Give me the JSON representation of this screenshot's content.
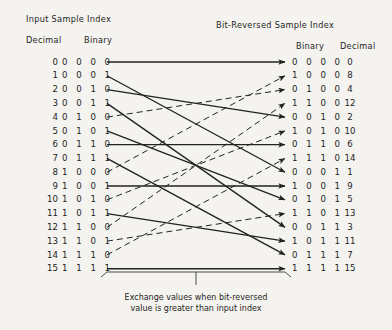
{
  "headers": {
    "left_title": "Input Sample Index",
    "left_decimal": "Decimal",
    "left_binary": "Binary",
    "right_title": "Bit-Reversed Sample Index",
    "right_binary": "Binary",
    "right_decimal": "Decimal"
  },
  "caption_line1": "Exchange values when bit-reversed",
  "caption_line2": "value is greater than input index",
  "colors": {
    "background": "#f5f3ef",
    "ink": "#1a1a1a",
    "line": "#222222"
  },
  "chart_data": {
    "type": "diagram",
    "bits": 4,
    "left_column_header": "Input Sample Index",
    "right_column_header": "Bit-Reversed Sample Index",
    "rows": [
      {
        "index": 0,
        "decimal": "0",
        "binary": "0 0 0 0",
        "rev_binary": "0 0 0 0",
        "rev_decimal": "0",
        "rev_index": 0,
        "style": "solid"
      },
      {
        "index": 1,
        "decimal": "1",
        "binary": "0 0 0 1",
        "rev_binary": "1 0 0 0",
        "rev_decimal": "8",
        "rev_index": 8,
        "style": "solid"
      },
      {
        "index": 2,
        "decimal": "2",
        "binary": "0 0 1 0",
        "rev_binary": "0 1 0 0",
        "rev_decimal": "4",
        "rev_index": 4,
        "style": "solid"
      },
      {
        "index": 3,
        "decimal": "3",
        "binary": "0 0 1 1",
        "rev_binary": "1 1 0 0",
        "rev_decimal": "12",
        "rev_index": 12,
        "style": "solid"
      },
      {
        "index": 4,
        "decimal": "4",
        "binary": "0 1 0 0",
        "rev_binary": "0 0 1 0",
        "rev_decimal": "2",
        "rev_index": 2,
        "style": "dashed"
      },
      {
        "index": 5,
        "decimal": "5",
        "binary": "0 1 0 1",
        "rev_binary": "1 0 1 0",
        "rev_decimal": "10",
        "rev_index": 10,
        "style": "solid"
      },
      {
        "index": 6,
        "decimal": "6",
        "binary": "0 1 1 0",
        "rev_binary": "0 1 1 0",
        "rev_decimal": "6",
        "rev_index": 6,
        "style": "solid"
      },
      {
        "index": 7,
        "decimal": "7",
        "binary": "0 1 1 1",
        "rev_binary": "1 1 1 0",
        "rev_decimal": "14",
        "rev_index": 14,
        "style": "solid"
      },
      {
        "index": 8,
        "decimal": "8",
        "binary": "1 0 0 0",
        "rev_binary": "0 0 0 1",
        "rev_decimal": "1",
        "rev_index": 1,
        "style": "dashed"
      },
      {
        "index": 9,
        "decimal": "9",
        "binary": "1 0 0 1",
        "rev_binary": "1 0 0 1",
        "rev_decimal": "9",
        "rev_index": 9,
        "style": "solid"
      },
      {
        "index": 10,
        "decimal": "10",
        "binary": "1 0 1 0",
        "rev_binary": "0 1 0 1",
        "rev_decimal": "5",
        "rev_index": 5,
        "style": "dashed"
      },
      {
        "index": 11,
        "decimal": "11",
        "binary": "1 0 1 1",
        "rev_binary": "1 1 0 1",
        "rev_decimal": "13",
        "rev_index": 13,
        "style": "solid"
      },
      {
        "index": 12,
        "decimal": "12",
        "binary": "1 1 0 0",
        "rev_binary": "0 0 1 1",
        "rev_decimal": "3",
        "rev_index": 3,
        "style": "dashed"
      },
      {
        "index": 13,
        "decimal": "13",
        "binary": "1 1 0 1",
        "rev_binary": "1 0 1 1",
        "rev_decimal": "11",
        "rev_index": 11,
        "style": "dashed"
      },
      {
        "index": 14,
        "decimal": "14",
        "binary": "1 1 1 0",
        "rev_binary": "0 1 1 1",
        "rev_decimal": "7",
        "rev_index": 7,
        "style": "dashed"
      },
      {
        "index": 15,
        "decimal": "15",
        "binary": "1 1 1 1",
        "rev_binary": "1 1 1 1",
        "rev_decimal": "15",
        "rev_index": 15,
        "style": "solid"
      }
    ]
  }
}
